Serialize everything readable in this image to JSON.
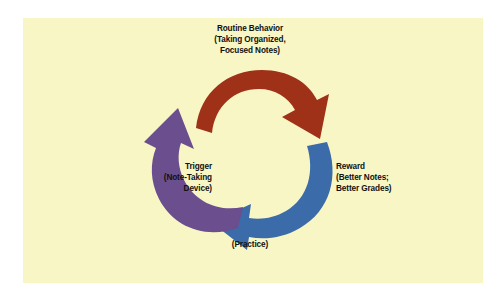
{
  "figure": {
    "background_color": "#FFFFFF",
    "panel_color": "#F8F6C4"
  },
  "cycle": {
    "direction": "clockwise",
    "steps": [
      {
        "id": "routine",
        "position": "top",
        "arrow_color": "#9E3118",
        "arrow_name": "routine-behavior-arrow",
        "lines": [
          "Routine Behavior",
          "(Taking Organized,",
          "Focused Notes)"
        ]
      },
      {
        "id": "reward",
        "position": "right",
        "arrow_color": "#3B6BA8",
        "arrow_name": "reward-arrow",
        "lines": [
          "Reward",
          "(Better Notes;",
          "Better Grades)"
        ]
      },
      {
        "id": "practice",
        "position": "bottom",
        "arrow_color": "#3B6BA8",
        "arrow_name": "practice-arrow",
        "lines": [
          "(Practice)"
        ]
      },
      {
        "id": "trigger",
        "position": "left",
        "arrow_color": "#6B4E8E",
        "arrow_name": "trigger-arrow",
        "lines": [
          "Trigger",
          "(Note-Taking",
          "Device)"
        ]
      }
    ]
  }
}
